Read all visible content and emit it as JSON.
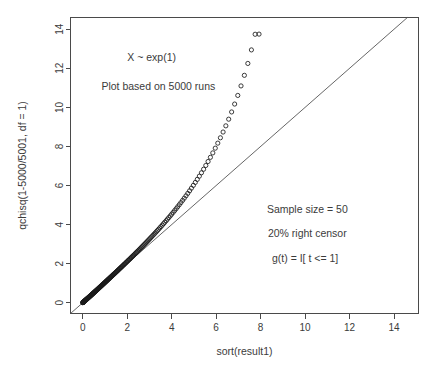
{
  "chart_data": {
    "type": "scatter",
    "title": "",
    "xlabel": "sort(result1)",
    "ylabel": "qchisq(1-5000/5001, df = 1)",
    "xlim": [
      -0.55,
      15.1
    ],
    "ylim": [
      -0.55,
      14.6
    ],
    "xticks": [
      0,
      2,
      4,
      6,
      8,
      10,
      12,
      14
    ],
    "yticks": [
      0,
      2,
      4,
      6,
      8,
      10,
      12,
      14
    ],
    "xtick_labels": [
      "0",
      "2",
      "4",
      "6",
      "8",
      "10",
      "12",
      "14"
    ],
    "ytick_labels": [
      "0",
      "2",
      "4",
      "6",
      "8",
      "10",
      "12",
      "14"
    ],
    "grid": false,
    "legend": "none",
    "point_marker": "open-circle",
    "point_color": "#1a1a1a",
    "reference_line": {
      "type": "identity",
      "slope": 1,
      "intercept": 0,
      "color": "#555555"
    },
    "annotations": [
      {
        "text": "X ~ exp(1)",
        "x": 3.1,
        "y": 12.35
      },
      {
        "text": "Plot based on 5000 runs",
        "x": 3.4,
        "y": 10.9
      },
      {
        "text": "Sample size = 50",
        "x": 10.1,
        "y": 4.6
      },
      {
        "text": "20% right censor",
        "x": 10.1,
        "y": 3.35
      },
      {
        "text": "g(t) = I[ t <= 1]",
        "x": 10.0,
        "y": 2.1
      }
    ],
    "x": [
      0.002,
      0.006,
      0.011,
      0.016,
      0.021,
      0.027,
      0.033,
      0.039,
      0.045,
      0.051,
      0.058,
      0.064,
      0.071,
      0.078,
      0.085,
      0.092,
      0.099,
      0.107,
      0.114,
      0.122,
      0.13,
      0.138,
      0.146,
      0.154,
      0.162,
      0.171,
      0.179,
      0.188,
      0.196,
      0.205,
      0.214,
      0.223,
      0.233,
      0.242,
      0.251,
      0.261,
      0.271,
      0.281,
      0.29,
      0.301,
      0.311,
      0.321,
      0.332,
      0.342,
      0.353,
      0.364,
      0.375,
      0.386,
      0.397,
      0.409,
      0.42,
      0.432,
      0.444,
      0.456,
      0.468,
      0.48,
      0.493,
      0.505,
      0.518,
      0.531,
      0.544,
      0.557,
      0.57,
      0.584,
      0.597,
      0.611,
      0.625,
      0.639,
      0.653,
      0.668,
      0.682,
      0.697,
      0.712,
      0.727,
      0.742,
      0.758,
      0.773,
      0.789,
      0.805,
      0.821,
      0.838,
      0.854,
      0.871,
      0.888,
      0.905,
      0.922,
      0.94,
      0.957,
      0.975,
      0.993,
      1.012,
      1.03,
      1.049,
      1.068,
      1.087,
      1.107,
      1.126,
      1.146,
      1.166,
      1.187,
      1.207,
      1.228,
      1.249,
      1.271,
      1.292,
      1.314,
      1.336,
      1.359,
      1.381,
      1.404,
      1.428,
      1.451,
      1.475,
      1.499,
      1.524,
      1.549,
      1.574,
      1.599,
      1.625,
      1.651,
      1.677,
      1.704,
      1.731,
      1.759,
      1.787,
      1.815,
      1.843,
      1.872,
      1.902,
      1.932,
      1.962,
      1.992,
      2.023,
      2.055,
      2.087,
      2.119,
      2.152,
      2.185,
      2.219,
      2.253,
      2.288,
      2.323,
      2.359,
      2.395,
      2.432,
      2.469,
      2.507,
      2.546,
      2.585,
      2.625,
      2.665,
      2.706,
      2.748,
      2.79,
      2.833,
      2.877,
      2.921,
      2.967,
      3.013,
      3.059,
      3.107,
      3.155,
      3.205,
      3.255,
      3.306,
      3.358,
      3.411,
      3.465,
      3.52,
      3.576,
      3.633,
      3.691,
      3.751,
      3.811,
      3.873,
      3.936,
      4.0,
      4.066,
      4.133,
      4.201,
      4.271,
      4.342,
      4.415,
      4.49,
      4.566,
      4.644,
      4.724,
      4.805,
      4.889,
      4.975,
      5.062,
      5.152,
      5.244,
      5.339,
      5.436,
      5.535,
      5.637,
      5.742,
      5.85,
      5.96,
      6.074,
      6.191,
      6.312,
      6.436,
      6.564,
      6.696,
      6.832,
      6.973,
      7.118,
      7.269,
      7.425,
      7.586,
      7.754,
      7.928,
      8.11,
      8.299,
      8.496,
      8.702,
      8.918,
      9.144,
      9.382,
      9.633,
      9.897,
      10.178,
      10.476,
      10.795,
      11.137,
      11.506,
      11.908,
      12.35,
      12.841,
      13.397,
      14.04,
      14.15
    ],
    "y": [
      0.003,
      0.008,
      0.013,
      0.018,
      0.023,
      0.03,
      0.036,
      0.042,
      0.048,
      0.055,
      0.061,
      0.068,
      0.075,
      0.082,
      0.089,
      0.096,
      0.104,
      0.111,
      0.119,
      0.127,
      0.135,
      0.143,
      0.151,
      0.159,
      0.168,
      0.176,
      0.185,
      0.193,
      0.202,
      0.211,
      0.22,
      0.23,
      0.239,
      0.249,
      0.258,
      0.268,
      0.278,
      0.288,
      0.298,
      0.309,
      0.319,
      0.33,
      0.34,
      0.351,
      0.362,
      0.373,
      0.385,
      0.396,
      0.408,
      0.42,
      0.431,
      0.444,
      0.456,
      0.468,
      0.481,
      0.494,
      0.506,
      0.519,
      0.533,
      0.546,
      0.56,
      0.573,
      0.587,
      0.601,
      0.615,
      0.63,
      0.644,
      0.659,
      0.674,
      0.689,
      0.704,
      0.72,
      0.735,
      0.751,
      0.767,
      0.783,
      0.8,
      0.816,
      0.833,
      0.85,
      0.867,
      0.885,
      0.902,
      0.92,
      0.938,
      0.957,
      0.975,
      0.994,
      1.013,
      1.032,
      1.051,
      1.071,
      1.091,
      1.111,
      1.131,
      1.152,
      1.173,
      1.194,
      1.215,
      1.237,
      1.259,
      1.281,
      1.303,
      1.326,
      1.349,
      1.372,
      1.396,
      1.42,
      1.444,
      1.468,
      1.493,
      1.518,
      1.544,
      1.57,
      1.596,
      1.622,
      1.649,
      1.677,
      1.704,
      1.733,
      1.761,
      1.79,
      1.819,
      1.849,
      1.879,
      1.91,
      1.941,
      1.973,
      2.005,
      2.037,
      2.07,
      2.104,
      2.138,
      2.173,
      2.208,
      2.244,
      2.28,
      2.317,
      2.355,
      2.393,
      2.432,
      2.472,
      2.512,
      2.553,
      2.595,
      2.637,
      2.681,
      2.725,
      2.77,
      2.816,
      2.863,
      2.91,
      2.959,
      3.009,
      3.059,
      3.111,
      3.164,
      3.218,
      3.273,
      3.329,
      3.387,
      3.446,
      3.506,
      3.568,
      3.631,
      3.696,
      3.762,
      3.83,
      3.9,
      3.972,
      4.045,
      4.121,
      4.199,
      4.279,
      4.361,
      4.446,
      4.534,
      4.624,
      4.718,
      4.814,
      4.914,
      5.018,
      5.125,
      5.237,
      5.352,
      5.473,
      5.598,
      5.729,
      5.866,
      6.008,
      6.158,
      6.315,
      6.479,
      6.652,
      6.834,
      7.026,
      7.229,
      7.443,
      7.67,
      7.912,
      8.169,
      8.444,
      8.738,
      9.055,
      9.396,
      9.766,
      10.17,
      10.611,
      11.098,
      11.64,
      12.248,
      12.941,
      13.742,
      13.75
    ]
  }
}
